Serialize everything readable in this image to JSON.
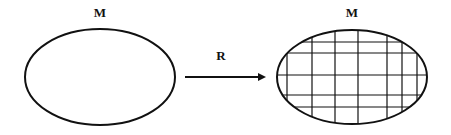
{
  "diagram": {
    "left_label": "M",
    "arrow_label": "R",
    "right_label": "M",
    "colors": {
      "stroke": "#111111",
      "background": "#ffffff"
    },
    "left_shape": {
      "type": "ellipse",
      "fill": "empty"
    },
    "right_shape": {
      "type": "ellipse",
      "fill": "grid",
      "vertical_lines": 7,
      "horizontal_lines": 5
    },
    "arrow": {
      "direction": "right"
    }
  }
}
